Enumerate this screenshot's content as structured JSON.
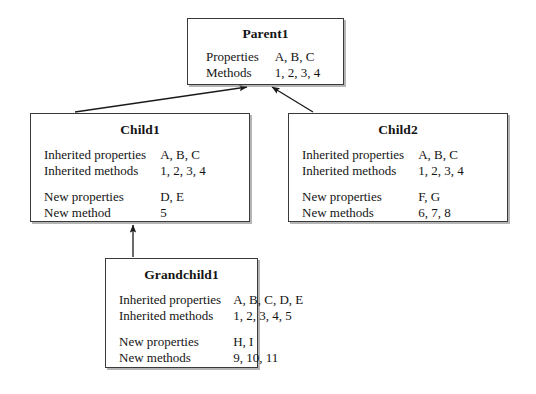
{
  "diagram": {
    "type": "class-inheritance-diagram",
    "line_color": "#1a1a1a",
    "box_border_color": "#3a3a3a",
    "box_fill": "#ffffff",
    "nodes": [
      {
        "id": "parent1",
        "title": "Parent1",
        "rows": [
          {
            "label": "Properties",
            "value": "A, B, C"
          },
          {
            "label": "Methods",
            "value": "1, 2, 3, 4"
          }
        ]
      },
      {
        "id": "child1",
        "title": "Child1",
        "rows": [
          {
            "label": "Inherited properties",
            "value": "A, B, C"
          },
          {
            "label": "Inherited methods",
            "value": "1, 2, 3, 4"
          },
          {
            "label": "",
            "value": "",
            "spacer": true
          },
          {
            "label": "New properties",
            "value": "D, E"
          },
          {
            "label": "New method",
            "value": "5"
          }
        ]
      },
      {
        "id": "child2",
        "title": "Child2",
        "rows": [
          {
            "label": "Inherited properties",
            "value": "A, B, C"
          },
          {
            "label": "Inherited methods",
            "value": "1, 2, 3, 4"
          },
          {
            "label": "",
            "value": "",
            "spacer": true
          },
          {
            "label": "New properties",
            "value": "F, G"
          },
          {
            "label": "New methods",
            "value": "6, 7, 8"
          }
        ]
      },
      {
        "id": "grandchild1",
        "title": "Grandchild1",
        "rows": [
          {
            "label": "Inherited properties",
            "value": "A, B, C, D, E"
          },
          {
            "label": "Inherited methods",
            "value": "1, 2, 3, 4, 5"
          },
          {
            "label": "",
            "value": "",
            "spacer": true
          },
          {
            "label": "New properties",
            "value": "H, I"
          },
          {
            "label": "New methods",
            "value": "9, 10, 11"
          }
        ]
      }
    ],
    "edges": [
      {
        "id": "child1-to-parent1",
        "from": "child1",
        "to": "parent1",
        "arrow": "filled-triangle"
      },
      {
        "id": "child2-to-parent1",
        "from": "child2",
        "to": "parent1",
        "arrow": "filled-triangle"
      },
      {
        "id": "grandchild1-to-child1",
        "from": "grandchild1",
        "to": "child1",
        "arrow": "filled-triangle"
      }
    ]
  }
}
